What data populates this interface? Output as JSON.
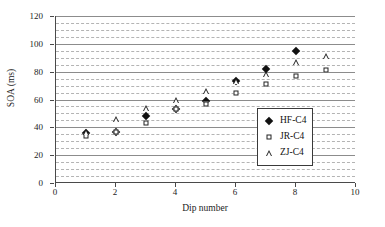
{
  "chart_data": {
    "type": "scatter",
    "title": "",
    "xlabel": "Dip number",
    "ylabel": "SOA (ms)",
    "xlim": [
      0,
      10
    ],
    "ylim": [
      0,
      120
    ],
    "xticks": [
      0,
      2,
      4,
      6,
      8,
      10
    ],
    "yticks": [
      0,
      20,
      40,
      60,
      80,
      100,
      120
    ],
    "xtick_labels": [
      "0",
      "2",
      "4",
      "6",
      "8",
      "10"
    ],
    "ytick_labels": [
      "0",
      "20",
      "40",
      "60",
      "80",
      "100",
      "120"
    ],
    "grid": {
      "major_step": 20,
      "minor_step": 5,
      "horizontal_major": true,
      "horizontal_minor": true,
      "vertical": false
    },
    "legend": {
      "position": "center-right",
      "entries": [
        {
          "label": "HF-C4",
          "marker": "filled-diamond"
        },
        {
          "label": "JR-C4",
          "marker": "open-square"
        },
        {
          "label": "ZJ-C4",
          "marker": "open-triangle"
        }
      ]
    },
    "series": [
      {
        "name": "HF-C4",
        "marker": "filled-diamond",
        "x": [
          1,
          2,
          3,
          4,
          5,
          6,
          7,
          8
        ],
        "y": [
          36,
          37,
          48,
          53,
          59,
          73,
          82,
          95
        ]
      },
      {
        "name": "JR-C4",
        "marker": "open-square",
        "x": [
          1,
          2,
          3,
          4,
          5,
          6,
          7,
          8,
          9
        ],
        "y": [
          34,
          37,
          43,
          53,
          57,
          65,
          71,
          77,
          81
        ]
      },
      {
        "name": "ZJ-C4",
        "marker": "open-triangle",
        "x": [
          1,
          2,
          3,
          4,
          5,
          6,
          7,
          8,
          9
        ],
        "y": [
          37,
          46,
          54,
          60,
          66,
          73,
          78,
          87,
          91
        ]
      }
    ]
  }
}
